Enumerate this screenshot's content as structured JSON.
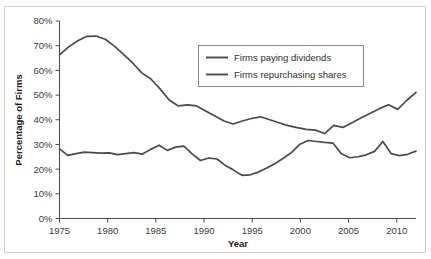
{
  "chart_data": {
    "type": "line",
    "title": "",
    "xlabel": "Year",
    "ylabel": "Percentage of Firms",
    "xlim": [
      1975,
      2012
    ],
    "ylim": [
      0,
      80
    ],
    "grid": false,
    "legend_position": "upper-center",
    "x_ticks": [
      "1975",
      "1980",
      "1985",
      "1990",
      "1995",
      "2000",
      "2005",
      "2010"
    ],
    "x_tick_values": [
      1975,
      1980,
      1985,
      1990,
      1995,
      2000,
      2005,
      2010
    ],
    "y_ticks": [
      "0%",
      "10%",
      "20%",
      "30%",
      "40%",
      "50%",
      "60%",
      "70%",
      "80%"
    ],
    "y_tick_values": [
      0,
      10,
      20,
      30,
      40,
      50,
      60,
      70,
      80
    ],
    "x": [
      1975,
      1976,
      1977,
      1978,
      1979,
      1980,
      1981,
      1982,
      1983,
      1984,
      1985,
      1986,
      1987,
      1988,
      1989,
      1990,
      1991,
      1992,
      1993,
      1994,
      1995,
      1996,
      1997,
      1998,
      1999,
      2000,
      2001,
      2002,
      2003,
      2004,
      2005,
      2006,
      2007,
      2008,
      2009,
      2010,
      2011,
      2012
    ],
    "series": [
      {
        "name": "Firms paying dividends",
        "color": "#4a4a4a",
        "values": [
          66.3,
          69.5,
          72.0,
          73.8,
          73.9,
          72.6,
          69.8,
          66.5,
          63.0,
          59.0,
          56.5,
          52.5,
          48.0,
          45.6,
          46.0,
          45.6,
          43.5,
          41.5,
          39.5,
          38.3,
          39.5,
          40.5,
          41.2,
          40.0,
          38.8,
          37.6,
          36.8,
          36.1,
          35.8,
          34.4,
          37.7,
          36.9,
          38.8,
          40.8,
          42.6,
          44.5,
          46.1,
          44.2
        ]
      },
      {
        "name": "Firms repurchasing shares",
        "color": "#4a4a4a",
        "values": [
          28.2,
          25.6,
          26.3,
          26.9,
          26.7,
          26.5,
          26.6,
          25.9,
          26.3,
          26.7,
          26.1,
          28.0,
          29.7,
          27.6,
          28.9,
          29.3,
          26.2,
          23.5,
          24.5,
          24.1,
          21.5,
          19.6,
          17.5,
          17.7,
          18.8,
          20.5,
          22.3,
          24.4,
          26.8,
          30.1,
          31.6,
          31.2,
          30.8,
          30.5,
          26.2,
          24.6,
          25.0,
          25.8
        ]
      }
    ],
    "series_extra": {
      "dividends_tail": [
        47.9,
        51.1
      ],
      "repurchase_tail": [
        27.2,
        31.2,
        26.3,
        25.5,
        26.0,
        27.3
      ]
    }
  },
  "legend": {
    "entries": [
      {
        "label": "Firms paying dividends"
      },
      {
        "label": "Firms repurchasing shares"
      }
    ]
  },
  "colors": {
    "line": "#4a4a4a",
    "axis": "#4a4a4a",
    "frame": "#cfcfcf",
    "text": "#2e2e2e",
    "background": "#ffffff"
  }
}
